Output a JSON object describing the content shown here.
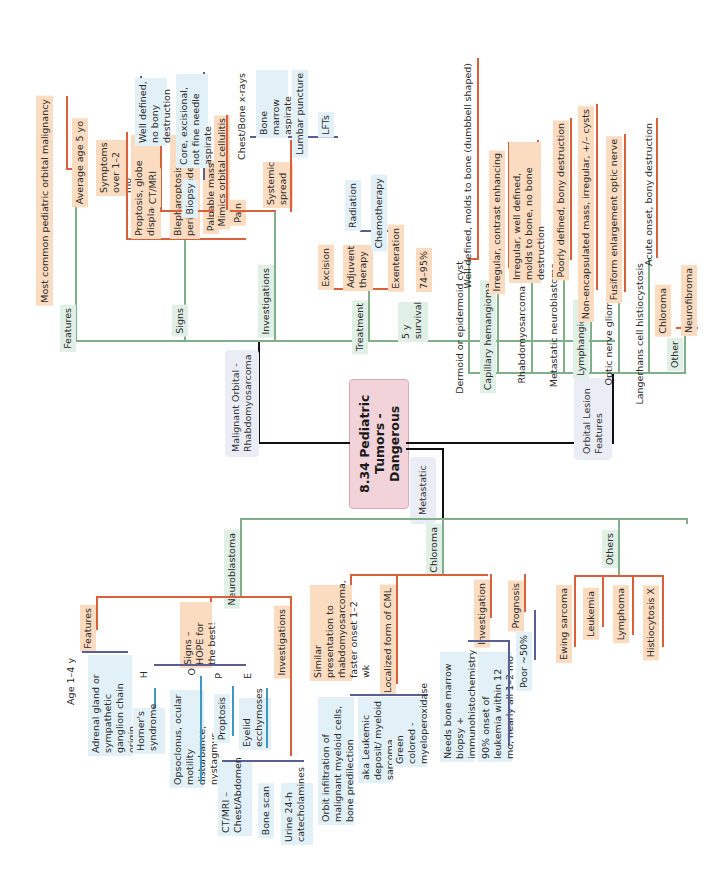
{
  "title": "8.34 Pediatric Tumors - Dangerous",
  "colors": {
    "root": "#f2d3da",
    "green_branch": "#7fb08a",
    "orange_branch": "#d9603b",
    "purple_branch": "#5a5f93",
    "blue_branch": "#3d99c4",
    "orange_fill": "#fbdcc0",
    "blue_fill": "#e2f1f8",
    "green_fill": "#e1f0e6"
  },
  "rhabdo": {
    "category": "Malignant Orbital - Rhabdomyosarcoma",
    "features": {
      "label": "Features",
      "items": [
        "Most common pediatric orbital malignancy",
        "Average age 5 yo",
        "Symptoms over 1–2 mo"
      ]
    },
    "signs": {
      "label": "Signs",
      "items": [
        "Proptosis, globe displacement",
        "Blepharoptosis, periorbital edema",
        "Palpable mass",
        "Pain"
      ]
    },
    "investigations": {
      "label": "Investigations",
      "ct_mri": {
        "label": "CT/MRI",
        "detail": "Well defined, no bony destruction"
      },
      "biopsy": {
        "label": "Biopsy",
        "detail": "Core, excisional, not fine needle aspirate"
      },
      "mimics": "Mimics orbital cellulitis",
      "systemic": {
        "label": "Systemic spread",
        "items": [
          "Chest/Bone x-rays",
          "Bone marrow aspirate trephine",
          "Lumbar puncture",
          "LFTs"
        ]
      }
    },
    "treatment": {
      "label": "Treatment",
      "excision": "Excision",
      "adjuvant": {
        "label": "Adjuvent therapy",
        "items": [
          "Radiation",
          "Chemotherapy"
        ]
      },
      "exenteration": "Exenteration"
    },
    "survival": {
      "label": "5 y survival",
      "value": "74–95%"
    }
  },
  "orbital_lesion": {
    "category": "Orbital Lesion Features",
    "items": [
      {
        "name": "Dermoid or epidermoid cyst",
        "detail": "Well defined, molds to bone (dumbbell shaped)"
      },
      {
        "name": "Capillary hemangioma",
        "detail": "Irregular, contrast enhancing"
      },
      {
        "name": "Rhabdomyosarcoma",
        "detail": "Irregular, well defined, molds to bone, no bone destruction"
      },
      {
        "name": "Metastatic neuroblastoma",
        "detail": "Poorly defined, bony destruction"
      },
      {
        "name": "Lymphangioma",
        "detail": "Non-encapsulated mass, irregular, +/– cysts"
      },
      {
        "name": "Optic nerve glioma",
        "detail": "Fusiform enlargement optic nerve"
      },
      {
        "name": "Langerhans cell histiocystosis",
        "detail": "Acute onset, bony destruction"
      }
    ],
    "other": {
      "label": "Other",
      "items": [
        "Chloroma",
        "Neurofibroma"
      ]
    }
  },
  "metastatic": {
    "category": "Metastatic",
    "neuroblastoma": {
      "label": "Neuroblastoma",
      "features": {
        "label": "Features",
        "items": [
          "Age 1–4 y",
          "Adrenal gland or sympathetic ganglion chain origin"
        ]
      },
      "signs": {
        "label": "Signs – HOPE for the best!",
        "H": {
          "letter": "H",
          "detail": "Horner's syndrome"
        },
        "O": {
          "letter": "O",
          "detail": "Opsoclonus, ocular motility disturbance, nystagmus"
        },
        "P": {
          "letter": "P",
          "detail": "Proptosis"
        },
        "E": {
          "letter": "E",
          "detail": "Eyelid ecchymoses"
        }
      },
      "investigations": {
        "label": "Investigations",
        "items": [
          "CT/MRI – Chest/Abdomen",
          "Bone scan",
          "Urine 24-h catecholamines"
        ]
      }
    },
    "chloroma": {
      "label": "Chloroma",
      "similar": "Similar presentation to rhabdomyosarcoma, faster onset 1–2 wk",
      "localized": {
        "label": "Localized form of CML",
        "items": [
          "Orbit infiltration of malignant myeloid cells, bone predilection",
          "aka Leukemic deposit/ myeloid sarcoma",
          "Green colored - myeloperoxidase"
        ]
      },
      "investigation": {
        "label": "Investigation",
        "items": [
          "Needs bone marrow biopsy + immunohistochemistry",
          "90% onset of leukemia within 12 mo, nearly all 1–2 mo"
        ]
      },
      "prognosis": {
        "label": "Prognosis",
        "value": "Poor ~50%"
      }
    },
    "others": {
      "label": "Others",
      "items": [
        "Ewing sarcoma",
        "Leukemia",
        "Lymphoma",
        "Histiocytosis X"
      ]
    }
  }
}
